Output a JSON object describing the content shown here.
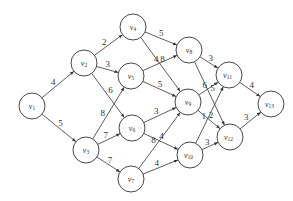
{
  "diagram": {
    "type": "directed-weighted-graph",
    "node_radius": 13,
    "colors": {
      "stroke": "#333333",
      "fill": "#ffffff",
      "background": "#ffffff"
    },
    "nodes": [
      {
        "id": "v1",
        "label": "v",
        "sub": "1",
        "x": 32,
        "y": 106
      },
      {
        "id": "v2",
        "label": "v",
        "sub": "2",
        "x": 84,
        "y": 63
      },
      {
        "id": "v3",
        "label": "v",
        "sub": "3",
        "x": 86,
        "y": 150
      },
      {
        "id": "v4",
        "label": "v",
        "sub": "4",
        "x": 133,
        "y": 27
      },
      {
        "id": "v5",
        "label": "v",
        "sub": "5",
        "x": 131,
        "y": 76
      },
      {
        "id": "v6",
        "label": "v",
        "sub": "6",
        "x": 132,
        "y": 128
      },
      {
        "id": "v7",
        "label": "v",
        "sub": "7",
        "x": 131,
        "y": 179
      },
      {
        "id": "v8",
        "label": "v",
        "sub": "8",
        "x": 189,
        "y": 50
      },
      {
        "id": "v9",
        "label": "v",
        "sub": "9",
        "x": 188,
        "y": 102
      },
      {
        "id": "v10",
        "label": "v",
        "sub": "10",
        "x": 190,
        "y": 155
      },
      {
        "id": "v11",
        "label": "v",
        "sub": "11",
        "x": 229,
        "y": 75
      },
      {
        "id": "v12",
        "label": "v",
        "sub": "12",
        "x": 230,
        "y": 137
      },
      {
        "id": "v13",
        "label": "v",
        "sub": "13",
        "x": 271,
        "y": 104
      }
    ],
    "edges": [
      {
        "from": "v1",
        "to": "v2",
        "weight": "4"
      },
      {
        "from": "v1",
        "to": "v3",
        "weight": "5"
      },
      {
        "from": "v2",
        "to": "v4",
        "weight": "2"
      },
      {
        "from": "v2",
        "to": "v5",
        "weight": "3"
      },
      {
        "from": "v2",
        "to": "v6",
        "weight": "6"
      },
      {
        "from": "v3",
        "to": "v5",
        "weight": "8"
      },
      {
        "from": "v3",
        "to": "v6",
        "weight": "7"
      },
      {
        "from": "v3",
        "to": "v7",
        "weight": "7"
      },
      {
        "from": "v4",
        "to": "v8",
        "weight": "5"
      },
      {
        "from": "v4",
        "to": "v9",
        "weight": "8"
      },
      {
        "from": "v5",
        "to": "v8",
        "weight": "4"
      },
      {
        "from": "v5",
        "to": "v9",
        "weight": "5"
      },
      {
        "from": "v6",
        "to": "v9",
        "weight": "3"
      },
      {
        "from": "v6",
        "to": "v10",
        "weight": "4"
      },
      {
        "from": "v7",
        "to": "v9",
        "weight": "8"
      },
      {
        "from": "v7",
        "to": "v10",
        "weight": "4"
      },
      {
        "from": "v8",
        "to": "v11",
        "weight": "3"
      },
      {
        "from": "v8",
        "to": "v12",
        "weight": "5"
      },
      {
        "from": "v9",
        "to": "v11",
        "weight": "6"
      },
      {
        "from": "v9",
        "to": "v12",
        "weight": "2"
      },
      {
        "from": "v10",
        "to": "v11",
        "weight": "1"
      },
      {
        "from": "v10",
        "to": "v12",
        "weight": "3"
      },
      {
        "from": "v11",
        "to": "v13",
        "weight": "4"
      },
      {
        "from": "v12",
        "to": "v13",
        "weight": "3"
      }
    ]
  }
}
